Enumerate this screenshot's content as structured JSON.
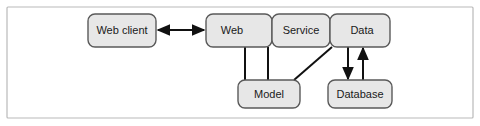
{
  "figure": {
    "background_color": "#ffffff",
    "frame": {
      "x": 7,
      "y": 7,
      "width": 466,
      "height": 111,
      "stroke_color": "#b9b9b9"
    }
  },
  "style": {
    "box_fill": "#e7e7e7",
    "box_stroke": "#5a5a5a",
    "connector_color": "#111111",
    "label_color": "#1a1a1a"
  },
  "nodes": [
    {
      "id": "web-client",
      "label": "Web client",
      "x": 88,
      "y": 14,
      "width": 68,
      "height": 33,
      "rx": 7
    },
    {
      "id": "web",
      "label": "Web",
      "x": 206,
      "y": 14,
      "width": 66,
      "height": 33,
      "rx": 7
    },
    {
      "id": "service",
      "label": "Service",
      "x": 272,
      "y": 14,
      "width": 58,
      "height": 33,
      "rx": 7
    },
    {
      "id": "data",
      "label": "Data",
      "x": 330,
      "y": 14,
      "width": 60,
      "height": 33,
      "rx": 7
    },
    {
      "id": "model",
      "label": "Model",
      "x": 238,
      "y": 80,
      "width": 62,
      "height": 28,
      "rx": 7
    },
    {
      "id": "database",
      "label": "Database",
      "x": 328,
      "y": 80,
      "width": 64,
      "height": 28,
      "rx": 7
    }
  ],
  "connectors": [
    {
      "id": "web-client-to-web",
      "from": "web-client",
      "to": "web",
      "kind": "bidirectional-horizontal",
      "x1": 158,
      "x2": 204,
      "y": 30
    },
    {
      "id": "web-to-service",
      "from": "web",
      "to": "service",
      "kind": "bidirectional-pair-horizontal",
      "x1": 258,
      "x2": 286,
      "y_top": 25,
      "y_bottom": 36
    },
    {
      "id": "service-to-data",
      "from": "service",
      "to": "data",
      "kind": "bidirectional-pair-horizontal",
      "x1": 316,
      "x2": 344,
      "y_top": 25,
      "y_bottom": 36
    },
    {
      "id": "model-to-web",
      "from": "model",
      "to": "web",
      "kind": "plain-vertical",
      "x": 245,
      "y1": 47,
      "y2": 80
    },
    {
      "id": "model-to-service",
      "from": "model",
      "to": "service",
      "kind": "plain-vertical",
      "x": 268,
      "y1": 47,
      "y2": 80
    },
    {
      "id": "model-to-data",
      "from": "model",
      "to": "data",
      "kind": "plain-diagonal",
      "x1": 294,
      "y1": 80,
      "x2": 332,
      "y2": 47
    },
    {
      "id": "data-to-database",
      "from": "data",
      "to": "database",
      "kind": "arrow-down",
      "x": 348,
      "y1": 47,
      "y2": 80
    },
    {
      "id": "database-to-data",
      "from": "database",
      "to": "data",
      "kind": "arrow-up",
      "x": 363,
      "y1": 80,
      "y2": 47
    }
  ]
}
